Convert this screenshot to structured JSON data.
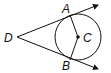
{
  "diagram": {
    "type": "geometry-tangents",
    "labels": {
      "A": "A",
      "B": "B",
      "C": "C",
      "D": "D"
    },
    "colors": {
      "stroke": "#111111",
      "background": "#ffffff"
    }
  }
}
